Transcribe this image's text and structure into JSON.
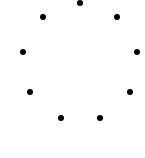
{
  "spinner": {
    "label": "loading-spinner",
    "dot_color": "#000000",
    "dot_count": 9,
    "dots": [
      {
        "x": 80,
        "y": 3
      },
      {
        "x": 117,
        "y": 17
      },
      {
        "x": 137,
        "y": 52
      },
      {
        "x": 130,
        "y": 92
      },
      {
        "x": 100,
        "y": 118
      },
      {
        "x": 61,
        "y": 118
      },
      {
        "x": 30,
        "y": 92
      },
      {
        "x": 23,
        "y": 52
      },
      {
        "x": 43,
        "y": 17
      }
    ]
  }
}
